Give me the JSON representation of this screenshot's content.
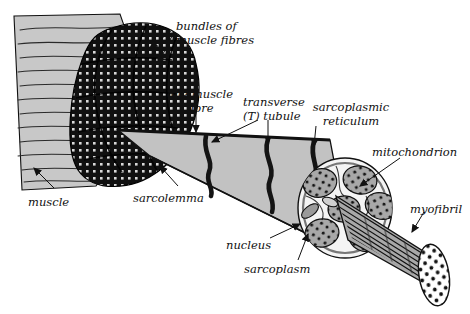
{
  "diagram": {
    "background_color": "#ffffff",
    "ink_color": "#111111",
    "palette": {
      "muscle_body_gray": "#c8c8c8",
      "bundle_dark": "#101010",
      "bundle_stipple": "#d8d8d8",
      "fibre_gray": "#c2c2c2",
      "tubule_black": "#141414",
      "myofibril_gray": "#a8a8a8",
      "myofibril_dot": "#111111",
      "sarcoplasm_white": "#f4f4f4",
      "nucleus_gray": "#9a9a9a",
      "endcap_white": "#ffffff"
    },
    "labels": [
      {
        "id": "bundles-of-muscle-fibres",
        "text": "bundles of\nmuscle fibres",
        "x": 176,
        "y": 20,
        "align": "left"
      },
      {
        "id": "one-muscle-fibre",
        "text": "one muscle\nfibre",
        "x": 168,
        "y": 88,
        "align": "center"
      },
      {
        "id": "transverse-t-tubule",
        "text": "transverse\n(T) tubule",
        "x": 243,
        "y": 96,
        "align": "left"
      },
      {
        "id": "sarcoplasmic-reticulum",
        "text": "sarcoplasmic\nreticulum",
        "x": 311,
        "y": 101,
        "align": "center"
      },
      {
        "id": "mitochondrion",
        "text": "mitochondrion",
        "x": 372,
        "y": 146,
        "align": "left"
      },
      {
        "id": "muscle",
        "text": "muscle",
        "x": 28,
        "y": 196,
        "align": "left"
      },
      {
        "id": "sarcolemma",
        "text": "sarcolemma",
        "x": 133,
        "y": 192,
        "align": "left"
      },
      {
        "id": "myofibril",
        "text": "myofibril",
        "x": 410,
        "y": 203,
        "align": "left"
      },
      {
        "id": "nucleus",
        "text": "nucleus",
        "x": 226,
        "y": 239,
        "align": "left"
      },
      {
        "id": "sarcoplasm",
        "text": "sarcoplasm",
        "x": 244,
        "y": 263,
        "align": "left"
      }
    ],
    "structures": [
      {
        "id": "muscle-body",
        "description": "cut muscle belly with wavy striation lines",
        "fill": "#c8c8c8"
      },
      {
        "id": "fibre-bundles-mass",
        "description": "cluster of dark stippled muscle-fibre bundles",
        "fill": "#101010"
      },
      {
        "id": "single-muscle-fibre",
        "description": "tapering cone of one muscle fibre",
        "fill": "#c2c2c2"
      },
      {
        "id": "t-tubules",
        "description": "three dark transverse bands crossing the fibre",
        "fill": "#141414"
      },
      {
        "id": "fibre-cross-section",
        "description": "circular cut end showing myofibrils, sarcoplasm and nucleus",
        "fill": "#f4f4f4"
      },
      {
        "id": "myofibril-cylinder",
        "description": "striated myofibril cylinder with dotted end cap",
        "fill": "#a8a8a8"
      }
    ]
  }
}
